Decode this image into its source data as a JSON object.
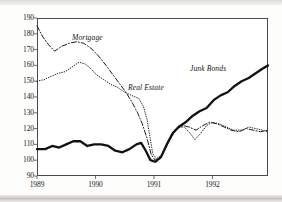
{
  "chart_data": {
    "type": "line",
    "title": "",
    "subtitle": "",
    "xlabel": "",
    "ylabel": "",
    "xlim": [
      1989.0,
      1992.95
    ],
    "ylim": [
      90,
      190
    ],
    "grid": false,
    "legend_position": "inline-annotations",
    "y_ticks": [
      190,
      180,
      170,
      160,
      150,
      140,
      130,
      120,
      110,
      100,
      90
    ],
    "x_ticks": [
      1989,
      1990,
      1991,
      1992
    ],
    "x_tick_labels": [
      "1989",
      "1990",
      "1991",
      "1992"
    ],
    "note": "Index values; all three series rebased and converging near 100 in early 1991.",
    "series": [
      {
        "name": "Mortgage",
        "style": "dash-dot",
        "color": "#1b1b1b",
        "label_position": {
          "x": 72,
          "y": 33
        },
        "points": [
          {
            "x": 1989.0,
            "y": 185
          },
          {
            "x": 1989.1,
            "y": 178
          },
          {
            "x": 1989.2,
            "y": 173
          },
          {
            "x": 1989.3,
            "y": 169
          },
          {
            "x": 1989.42,
            "y": 172
          },
          {
            "x": 1989.55,
            "y": 174
          },
          {
            "x": 1989.68,
            "y": 175
          },
          {
            "x": 1989.8,
            "y": 174
          },
          {
            "x": 1989.92,
            "y": 171
          },
          {
            "x": 1990.05,
            "y": 166
          },
          {
            "x": 1990.18,
            "y": 160
          },
          {
            "x": 1990.3,
            "y": 154
          },
          {
            "x": 1990.42,
            "y": 148
          },
          {
            "x": 1990.52,
            "y": 143
          },
          {
            "x": 1990.62,
            "y": 137
          },
          {
            "x": 1990.72,
            "y": 130
          },
          {
            "x": 1990.8,
            "y": 123
          },
          {
            "x": 1990.88,
            "y": 114
          },
          {
            "x": 1990.95,
            "y": 104
          },
          {
            "x": 1991.02,
            "y": 100
          },
          {
            "x": 1991.1,
            "y": 101
          },
          {
            "x": 1991.2,
            "y": 108
          },
          {
            "x": 1991.3,
            "y": 115
          },
          {
            "x": 1991.4,
            "y": 120
          },
          {
            "x": 1991.5,
            "y": 122
          },
          {
            "x": 1991.6,
            "y": 121
          },
          {
            "x": 1991.72,
            "y": 119
          },
          {
            "x": 1991.84,
            "y": 122
          },
          {
            "x": 1991.95,
            "y": 124
          },
          {
            "x": 1992.08,
            "y": 123
          },
          {
            "x": 1992.2,
            "y": 121
          },
          {
            "x": 1992.32,
            "y": 119
          },
          {
            "x": 1992.45,
            "y": 118
          },
          {
            "x": 1992.58,
            "y": 120
          },
          {
            "x": 1992.7,
            "y": 119
          },
          {
            "x": 1992.82,
            "y": 118
          },
          {
            "x": 1992.95,
            "y": 119
          }
        ]
      },
      {
        "name": "Real Estate",
        "style": "dotted",
        "color": "#242424",
        "label_position": {
          "x": 128,
          "y": 83
        },
        "points": [
          {
            "x": 1989.0,
            "y": 150
          },
          {
            "x": 1989.12,
            "y": 151
          },
          {
            "x": 1989.24,
            "y": 153
          },
          {
            "x": 1989.36,
            "y": 155
          },
          {
            "x": 1989.48,
            "y": 156
          },
          {
            "x": 1989.6,
            "y": 159
          },
          {
            "x": 1989.72,
            "y": 162
          },
          {
            "x": 1989.82,
            "y": 161
          },
          {
            "x": 1989.92,
            "y": 158
          },
          {
            "x": 1990.02,
            "y": 154
          },
          {
            "x": 1990.14,
            "y": 151
          },
          {
            "x": 1990.26,
            "y": 148
          },
          {
            "x": 1990.38,
            "y": 146
          },
          {
            "x": 1990.5,
            "y": 143
          },
          {
            "x": 1990.62,
            "y": 141
          },
          {
            "x": 1990.74,
            "y": 139
          },
          {
            "x": 1990.82,
            "y": 134
          },
          {
            "x": 1990.88,
            "y": 126
          },
          {
            "x": 1990.93,
            "y": 115
          },
          {
            "x": 1990.98,
            "y": 104
          },
          {
            "x": 1991.04,
            "y": 101
          },
          {
            "x": 1991.12,
            "y": 103
          },
          {
            "x": 1991.22,
            "y": 110
          },
          {
            "x": 1991.32,
            "y": 117
          },
          {
            "x": 1991.42,
            "y": 121
          },
          {
            "x": 1991.52,
            "y": 121
          },
          {
            "x": 1991.62,
            "y": 117
          },
          {
            "x": 1991.7,
            "y": 113
          },
          {
            "x": 1991.8,
            "y": 117
          },
          {
            "x": 1991.9,
            "y": 122
          },
          {
            "x": 1992.0,
            "y": 124
          },
          {
            "x": 1992.12,
            "y": 123
          },
          {
            "x": 1992.24,
            "y": 121
          },
          {
            "x": 1992.36,
            "y": 119
          },
          {
            "x": 1992.5,
            "y": 119
          },
          {
            "x": 1992.62,
            "y": 121
          },
          {
            "x": 1992.74,
            "y": 120
          },
          {
            "x": 1992.86,
            "y": 119
          },
          {
            "x": 1992.95,
            "y": 118
          }
        ]
      },
      {
        "name": "Junk Bonds",
        "style": "solid-thick",
        "color": "#111111",
        "label_position": {
          "x": 190,
          "y": 64
        },
        "points": [
          {
            "x": 1989.0,
            "y": 107
          },
          {
            "x": 1989.14,
            "y": 107
          },
          {
            "x": 1989.26,
            "y": 109
          },
          {
            "x": 1989.38,
            "y": 108
          },
          {
            "x": 1989.5,
            "y": 110
          },
          {
            "x": 1989.62,
            "y": 112
          },
          {
            "x": 1989.74,
            "y": 112
          },
          {
            "x": 1989.86,
            "y": 109
          },
          {
            "x": 1989.98,
            "y": 110
          },
          {
            "x": 1990.1,
            "y": 110
          },
          {
            "x": 1990.22,
            "y": 109
          },
          {
            "x": 1990.34,
            "y": 106
          },
          {
            "x": 1990.46,
            "y": 105
          },
          {
            "x": 1990.58,
            "y": 107
          },
          {
            "x": 1990.7,
            "y": 110
          },
          {
            "x": 1990.78,
            "y": 111
          },
          {
            "x": 1990.86,
            "y": 106
          },
          {
            "x": 1990.94,
            "y": 100
          },
          {
            "x": 1991.02,
            "y": 99
          },
          {
            "x": 1991.12,
            "y": 102
          },
          {
            "x": 1991.22,
            "y": 110
          },
          {
            "x": 1991.32,
            "y": 117
          },
          {
            "x": 1991.42,
            "y": 121
          },
          {
            "x": 1991.54,
            "y": 124
          },
          {
            "x": 1991.66,
            "y": 128
          },
          {
            "x": 1991.78,
            "y": 131
          },
          {
            "x": 1991.9,
            "y": 133
          },
          {
            "x": 1992.02,
            "y": 138
          },
          {
            "x": 1992.14,
            "y": 141
          },
          {
            "x": 1992.26,
            "y": 143
          },
          {
            "x": 1992.38,
            "y": 147
          },
          {
            "x": 1992.5,
            "y": 150
          },
          {
            "x": 1992.62,
            "y": 152
          },
          {
            "x": 1992.74,
            "y": 155
          },
          {
            "x": 1992.86,
            "y": 158
          },
          {
            "x": 1992.95,
            "y": 160
          }
        ]
      }
    ]
  }
}
